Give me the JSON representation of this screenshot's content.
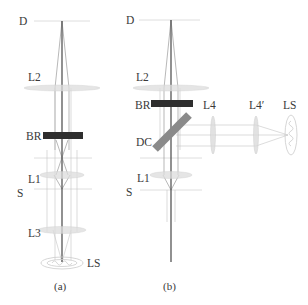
{
  "panels": [
    {
      "id": "a",
      "caption": "(a)",
      "labels": {
        "detector": "D",
        "lens2": "L2",
        "beam_rejector": "BR",
        "lens1": "L1",
        "sample": "S",
        "lens3": "L3",
        "light_source": "LS"
      }
    },
    {
      "id": "b",
      "caption": "(b)",
      "labels": {
        "detector": "D",
        "lens2": "L2",
        "beam_rejector": "BR",
        "dichroic": "DC",
        "lens1": "L1",
        "sample": "S",
        "lens4": "L4",
        "lens4_prime": "L4′",
        "light_source": "LS"
      }
    }
  ],
  "colors": {
    "beam_rejector": "#2e2e2e",
    "dichroic": "#8a8a8a",
    "optical_axis": "#555555",
    "lens": "#dcdcdc"
  }
}
